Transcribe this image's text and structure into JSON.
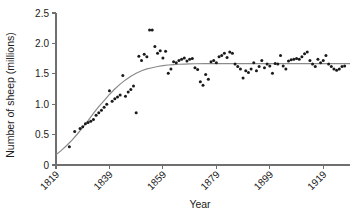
{
  "chart_data": {
    "type": "scatter",
    "title": "",
    "subtitle": "",
    "xlabel": "Year",
    "ylabel": "Number of sheep (millions)",
    "xlim": [
      1819,
      1929
    ],
    "ylim": [
      0,
      2.5
    ],
    "grid": false,
    "legend": "none",
    "x_ticks": [
      1819,
      1839,
      1859,
      1879,
      1899,
      1919
    ],
    "x_tick_labels": [
      "1819",
      "1839",
      "1859",
      "1879",
      "1899",
      "1919"
    ],
    "x_tick_rotation_deg": 45,
    "y_ticks": [
      0,
      0.5,
      1.0,
      1.5,
      2.0,
      2.5
    ],
    "y_tick_labels": [
      "0",
      "0.5",
      "1.0",
      "1.5",
      "2.0",
      "2.5"
    ],
    "point_color": "#1a1a1a",
    "curve_color": "#8a8a8a",
    "axis_color": "#6f6f6f",
    "background_color": "#ffffff",
    "series": [
      {
        "name": "Observed sheep population",
        "marker": "filled-circle",
        "x": [
          1824,
          1826,
          1828,
          1829,
          1830,
          1831,
          1832,
          1833,
          1834,
          1835,
          1836,
          1837,
          1838,
          1839,
          1840,
          1841,
          1842,
          1843,
          1844,
          1845,
          1846,
          1847,
          1848,
          1849,
          1850,
          1851,
          1852,
          1853,
          1854,
          1855,
          1856,
          1857,
          1858,
          1859,
          1860,
          1861,
          1862,
          1863,
          1864,
          1865,
          1866,
          1867,
          1868,
          1869,
          1870,
          1871,
          1872,
          1873,
          1874,
          1875,
          1876,
          1877,
          1878,
          1879,
          1880,
          1881,
          1882,
          1883,
          1884,
          1885,
          1886,
          1887,
          1888,
          1889,
          1890,
          1891,
          1892,
          1893,
          1894,
          1895,
          1896,
          1897,
          1898,
          1899,
          1900,
          1901,
          1902,
          1903,
          1904,
          1905,
          1906,
          1907,
          1908,
          1909,
          1910,
          1911,
          1912,
          1913,
          1914,
          1915,
          1916,
          1917,
          1918,
          1919,
          1920,
          1921,
          1922,
          1923,
          1924,
          1925,
          1926,
          1927
        ],
        "y": [
          0.3,
          0.55,
          0.6,
          0.63,
          0.68,
          0.7,
          0.72,
          0.75,
          0.82,
          0.86,
          0.9,
          0.95,
          1.0,
          1.22,
          1.05,
          1.09,
          1.12,
          1.15,
          1.47,
          1.13,
          1.2,
          1.24,
          1.3,
          0.86,
          1.79,
          1.72,
          1.82,
          1.78,
          2.22,
          2.22,
          1.95,
          1.84,
          1.88,
          1.76,
          1.87,
          1.51,
          1.58,
          1.7,
          1.68,
          1.72,
          1.74,
          1.76,
          1.71,
          1.74,
          1.75,
          1.6,
          1.57,
          1.37,
          1.31,
          1.49,
          1.41,
          1.7,
          1.72,
          1.68,
          1.78,
          1.8,
          1.84,
          1.77,
          1.86,
          1.84,
          1.66,
          1.62,
          1.58,
          1.43,
          1.55,
          1.52,
          1.58,
          1.68,
          1.55,
          1.62,
          1.72,
          1.6,
          1.66,
          1.63,
          1.51,
          1.67,
          1.66,
          1.8,
          1.63,
          1.58,
          1.71,
          1.73,
          1.74,
          1.75,
          1.74,
          1.78,
          1.83,
          1.86,
          1.72,
          1.66,
          1.62,
          1.74,
          1.68,
          1.72,
          1.8,
          1.66,
          1.62,
          1.58,
          1.56,
          1.58,
          1.62,
          1.63
        ]
      }
    ],
    "fitted_curve": {
      "name": "Logistic growth fit",
      "model": "logistic",
      "asymptote": 1.67,
      "start_value": 0.17,
      "x": [
        1819,
        1821,
        1823,
        1825,
        1827,
        1829,
        1831,
        1833,
        1835,
        1837,
        1839,
        1841,
        1843,
        1845,
        1847,
        1849,
        1851,
        1853,
        1855,
        1857,
        1859,
        1861,
        1863,
        1865,
        1867,
        1869,
        1871,
        1875,
        1880,
        1885,
        1890,
        1895,
        1900,
        1905,
        1910,
        1915,
        1920,
        1925,
        1929
      ],
      "y": [
        0.17,
        0.24,
        0.32,
        0.41,
        0.51,
        0.62,
        0.73,
        0.85,
        0.96,
        1.06,
        1.16,
        1.25,
        1.33,
        1.4,
        1.46,
        1.51,
        1.55,
        1.58,
        1.6,
        1.62,
        1.635,
        1.645,
        1.652,
        1.657,
        1.66,
        1.663,
        1.665,
        1.666,
        1.667,
        1.667,
        1.667,
        1.667,
        1.667,
        1.667,
        1.667,
        1.667,
        1.667,
        1.667,
        1.667
      ]
    }
  }
}
